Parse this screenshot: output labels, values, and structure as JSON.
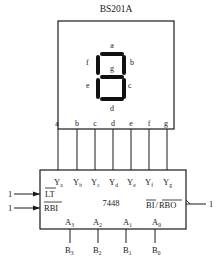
{
  "display": {
    "title": "BS201A",
    "segment_labels": {
      "a": "a",
      "b": "b",
      "c": "c",
      "d": "d",
      "e": "e",
      "f": "f",
      "g": "g"
    },
    "pins": [
      "a",
      "b",
      "c",
      "d",
      "e",
      "f",
      "g"
    ]
  },
  "decoder": {
    "chip_name": "7448",
    "outputs": [
      {
        "main": "Y",
        "sub": "a"
      },
      {
        "main": "Y",
        "sub": "b"
      },
      {
        "main": "Y",
        "sub": "c"
      },
      {
        "main": "Y",
        "sub": "d"
      },
      {
        "main": "Y",
        "sub": "e"
      },
      {
        "main": "Y",
        "sub": "f"
      },
      {
        "main": "Y",
        "sub": "g"
      }
    ],
    "inputs_left": [
      {
        "label": "LT",
        "value": "1"
      },
      {
        "label": "RBI",
        "value": "1"
      }
    ],
    "bi_rbo": {
      "label_bi": "BI",
      "slash": "/",
      "label_rbo": "RBO",
      "value": "1"
    },
    "address_inputs": [
      {
        "main": "A",
        "sub": "3"
      },
      {
        "main": "A",
        "sub": "2"
      },
      {
        "main": "A",
        "sub": "1"
      },
      {
        "main": "A",
        "sub": "0"
      }
    ],
    "b_inputs": [
      {
        "main": "B",
        "sub": "3"
      },
      {
        "main": "B",
        "sub": "2"
      },
      {
        "main": "B",
        "sub": "1"
      },
      {
        "main": "B",
        "sub": "0"
      }
    ]
  }
}
